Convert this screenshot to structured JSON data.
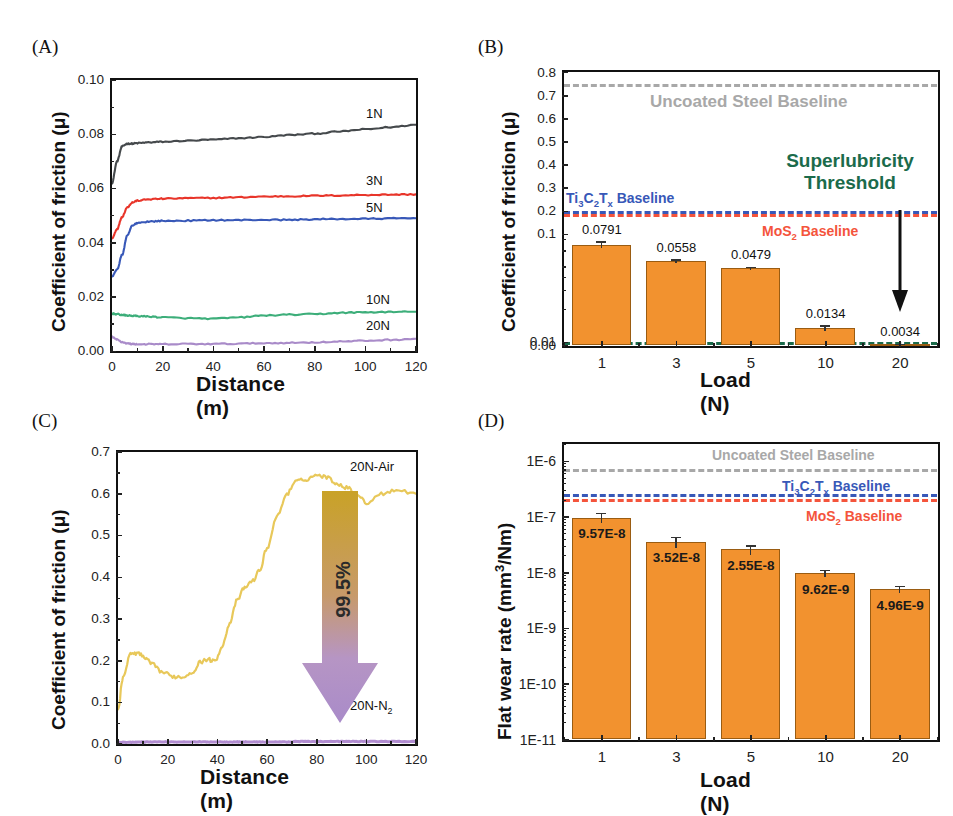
{
  "figure": {
    "panels": [
      "(A)",
      "(B)",
      "(C)",
      "(D)"
    ]
  },
  "panelA": {
    "tag": "(A)",
    "ylabel": "Coefficient of friction (μ)",
    "xlabel": "Distance (m)",
    "yticks": [
      "0.10",
      "0.08",
      "0.06",
      "0.04",
      "0.02",
      "0.00"
    ],
    "xticks": [
      "0",
      "20",
      "40",
      "60",
      "80",
      "100",
      "120"
    ],
    "series_labels": [
      "1N",
      "3N",
      "5N",
      "10N",
      "20N"
    ],
    "colors": {
      "1N": "#45494c",
      "3N": "#e8352a",
      "5N": "#3858b8",
      "10N": "#3dae7a",
      "20N": "#a98bc9"
    }
  },
  "panelB": {
    "tag": "(B)",
    "ylabel": "Coefficient of friction (μ)",
    "xlabel": "Load (N)",
    "yticks": [
      "0.8",
      "0.7",
      "0.6",
      "0.5",
      "0.4",
      "0.3",
      "0.2",
      "0.1",
      "0.01",
      "0.00"
    ],
    "xticks": [
      "1",
      "3",
      "5",
      "10",
      "20"
    ],
    "bar_labels": [
      "0.0791",
      "0.0558",
      "0.0479",
      "0.0134",
      "0.0034"
    ],
    "baselines": {
      "steel": "Uncoated Steel Baseline",
      "mxene": "Ti₃C₂Tₓ Baseline",
      "mos2": "MoS₂ Baseline"
    },
    "threshold_line1": "Superlubricity",
    "threshold_line2": "Threshold",
    "colors": {
      "bar": "#F2922F",
      "steel": "#a8a8a8",
      "mxene": "#3858b8",
      "mos2": "#f4543c",
      "threshold": "#1b6b4b"
    }
  },
  "panelC": {
    "tag": "(C)",
    "ylabel": "Coefficient of friction (μ)",
    "xlabel": "Distance (m)",
    "yticks": [
      "0.7",
      "0.6",
      "0.5",
      "0.4",
      "0.3",
      "0.2",
      "0.1",
      "0.0"
    ],
    "xticks": [
      "0",
      "20",
      "40",
      "60",
      "80",
      "100",
      "120"
    ],
    "series_labels": [
      "20N-Air",
      "20N-N₂"
    ],
    "reduction": "99.5%",
    "colors": {
      "air": "#e8c85a",
      "n2": "#b18cd0",
      "arrow_top": "#c9a227",
      "arrow_bottom": "#a98bc9"
    }
  },
  "panelD": {
    "tag": "(D)",
    "ylabel": "Flat wear rate (mm³/Nm)",
    "xlabel": "Load (N)",
    "yticks": [
      "1E-6",
      "1E-7",
      "1E-8",
      "1E-9",
      "1E-10",
      "1E-11"
    ],
    "xticks": [
      "1",
      "3",
      "5",
      "10",
      "20"
    ],
    "bar_labels": [
      "9.57E-8",
      "3.52E-8",
      "2.55E-8",
      "9.62E-9",
      "4.96E-9"
    ],
    "baselines": {
      "steel": "Uncoated Steel Baseline",
      "mxene": "Ti₃C₂Tₓ Baseline",
      "mos2": "MoS₂ Baseline"
    },
    "colors": {
      "bar": "#F2922F",
      "steel": "#a8a8a8",
      "mxene": "#3858b8",
      "mos2": "#f4543c"
    }
  },
  "chart_data": [
    {
      "type": "line",
      "panel": "A",
      "title": "",
      "xlabel": "Distance (m)",
      "ylabel": "Coefficient of friction (μ)",
      "xlim": [
        0,
        120
      ],
      "ylim": [
        0.0,
        0.1
      ],
      "grid": false,
      "legend": "inline-right",
      "x": [
        0,
        2,
        4,
        6,
        8,
        10,
        15,
        20,
        30,
        40,
        50,
        60,
        70,
        80,
        90,
        100,
        110,
        120
      ],
      "series": [
        {
          "name": "1N",
          "color": "#45494c",
          "values": [
            0.062,
            0.07,
            0.0755,
            0.0765,
            0.0765,
            0.0767,
            0.077,
            0.0772,
            0.0776,
            0.078,
            0.0785,
            0.079,
            0.0797,
            0.0802,
            0.081,
            0.0818,
            0.0826,
            0.0835
          ]
        },
        {
          "name": "3N",
          "color": "#e8352a",
          "values": [
            0.0415,
            0.045,
            0.0495,
            0.053,
            0.0548,
            0.0555,
            0.056,
            0.0562,
            0.0564,
            0.0565,
            0.0567,
            0.057,
            0.0571,
            0.0573,
            0.0574,
            0.0576,
            0.0577,
            0.0578
          ]
        },
        {
          "name": "5N",
          "color": "#3858b8",
          "values": [
            0.0275,
            0.03,
            0.0355,
            0.0425,
            0.0462,
            0.0473,
            0.0478,
            0.048,
            0.0481,
            0.0483,
            0.0483,
            0.0484,
            0.0484,
            0.0486,
            0.0487,
            0.0488,
            0.0489,
            0.049
          ]
        },
        {
          "name": "10N",
          "color": "#3dae7a",
          "values": [
            0.0138,
            0.0136,
            0.0133,
            0.0131,
            0.013,
            0.0129,
            0.0127,
            0.0124,
            0.0121,
            0.0119,
            0.0124,
            0.0131,
            0.0134,
            0.0136,
            0.0141,
            0.0143,
            0.0144,
            0.0145
          ]
        },
        {
          "name": "20N",
          "color": "#a98bc9",
          "values": [
            0.0052,
            0.0042,
            0.0033,
            0.0028,
            0.0026,
            0.0025,
            0.0025,
            0.0025,
            0.0026,
            0.0026,
            0.0027,
            0.0029,
            0.003,
            0.0032,
            0.0035,
            0.0038,
            0.0041,
            0.0045
          ]
        }
      ]
    },
    {
      "type": "bar",
      "panel": "B",
      "xlabel": "Load (N)",
      "ylabel": "Coefficient of friction (μ)",
      "categories": [
        "1",
        "3",
        "5",
        "10",
        "20"
      ],
      "values": [
        0.0791,
        0.0558,
        0.0479,
        0.0134,
        0.0034
      ],
      "errors": [
        0.006,
        0.002,
        0.0018,
        0.0008,
        0.0004
      ],
      "yticks": [
        0.8,
        0.7,
        0.6,
        0.5,
        0.4,
        0.3,
        0.2,
        0.1,
        0.01,
        0.0
      ],
      "axis_note": "hybrid linear-above-0.1 / log-below-0.1",
      "reference_lines": [
        {
          "label": "Uncoated Steel Baseline",
          "value": 0.75,
          "color": "#a8a8a8",
          "style": "dashed"
        },
        {
          "label": "Ti₃C₂Tₓ Baseline",
          "value": 0.2,
          "color": "#3858b8",
          "style": "dashed"
        },
        {
          "label": "MoS₂ Baseline",
          "value": 0.185,
          "color": "#f4543c",
          "style": "dashed"
        },
        {
          "label": "Superlubricity Threshold",
          "value": 0.01,
          "color": "#1b6b4b",
          "style": "dash-dot"
        }
      ]
    },
    {
      "type": "line",
      "panel": "C",
      "xlabel": "Distance (m)",
      "ylabel": "Coefficient of friction (μ)",
      "xlim": [
        0,
        120
      ],
      "ylim": [
        0.0,
        0.7
      ],
      "annotation": "99.5%",
      "x": [
        0,
        2,
        5,
        8,
        11,
        14,
        18,
        22,
        26,
        30,
        33,
        36,
        39,
        42,
        45,
        48,
        51,
        54,
        57,
        60,
        64,
        68,
        72,
        76,
        80,
        84,
        88,
        92,
        96,
        100,
        106,
        112,
        120
      ],
      "series": [
        {
          "name": "20N-Air",
          "color": "#e8c85a",
          "values": [
            0.08,
            0.16,
            0.215,
            0.218,
            0.205,
            0.19,
            0.172,
            0.162,
            0.16,
            0.172,
            0.196,
            0.203,
            0.198,
            0.235,
            0.29,
            0.345,
            0.375,
            0.39,
            0.415,
            0.47,
            0.545,
            0.6,
            0.63,
            0.635,
            0.645,
            0.64,
            0.625,
            0.615,
            0.6,
            0.578,
            0.6,
            0.61,
            0.6
          ]
        },
        {
          "name": "20N-N₂",
          "color": "#b18cd0",
          "values": [
            0.004,
            0.004,
            0.004,
            0.005,
            0.005,
            0.005,
            0.005,
            0.005,
            0.005,
            0.005,
            0.005,
            0.005,
            0.005,
            0.005,
            0.005,
            0.005,
            0.005,
            0.005,
            0.005,
            0.005,
            0.005,
            0.005,
            0.006,
            0.006,
            0.006,
            0.006,
            0.006,
            0.006,
            0.006,
            0.006,
            0.006,
            0.006,
            0.006
          ]
        }
      ]
    },
    {
      "type": "bar",
      "panel": "D",
      "xlabel": "Load (N)",
      "ylabel": "Flat wear rate (mm³/Nm)",
      "categories": [
        "1",
        "3",
        "5",
        "10",
        "20"
      ],
      "values": [
        9.57e-08,
        3.52e-08,
        2.55e-08,
        9.62e-09,
        4.96e-09
      ],
      "errors": [
        2e-08,
        8e-09,
        5e-09,
        1.4e-09,
        7e-10
      ],
      "yscale": "log",
      "ylim": [
        1e-11,
        2e-06
      ],
      "yticks": [
        1e-06,
        1e-07,
        1e-08,
        1e-09,
        1e-10,
        1e-11
      ],
      "reference_lines": [
        {
          "label": "Uncoated Steel Baseline",
          "value": 7e-07,
          "color": "#a8a8a8",
          "style": "dashed"
        },
        {
          "label": "Ti₃C₂Tₓ Baseline",
          "value": 2.5e-07,
          "color": "#3858b8",
          "style": "dashed"
        },
        {
          "label": "MoS₂ Baseline",
          "value": 2.1e-07,
          "color": "#f4543c",
          "style": "dashed"
        }
      ]
    }
  ]
}
